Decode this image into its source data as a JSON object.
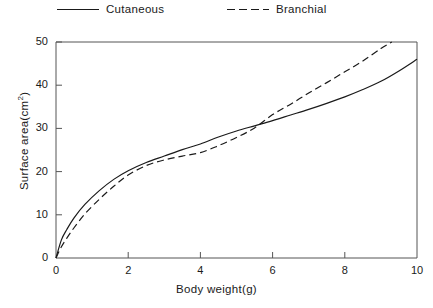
{
  "chart_data": {
    "type": "line",
    "title": "",
    "xlabel": "Body weight(g)",
    "ylabel": "Surface area(cm2)",
    "ylabel_text": "Surface area(cm",
    "ylabel_sup": "2",
    "ylabel_tail": ")",
    "xlim": [
      0,
      10
    ],
    "ylim": [
      0,
      50
    ],
    "xticks": [
      0,
      2,
      4,
      6,
      8,
      10
    ],
    "yticks": [
      0,
      10,
      20,
      30,
      40,
      50
    ],
    "xtick_labels": [
      "0",
      "2",
      "4",
      "6",
      "8",
      "10"
    ],
    "ytick_labels": [
      "0",
      "10",
      "20",
      "30",
      "40",
      "50"
    ],
    "grid": false,
    "legend_position": "above-plot",
    "series": [
      {
        "name": "Cutaneous",
        "style": "solid",
        "color": "#1a1a1a",
        "x": [
          0,
          0.15,
          0.3,
          0.5,
          0.8,
          1.2,
          1.6,
          2,
          2.5,
          3,
          3.5,
          4,
          4.5,
          5,
          5.5,
          6,
          6.5,
          7,
          7.5,
          8,
          8.5,
          9,
          9.5,
          10
        ],
        "y": [
          0,
          4.2,
          6.6,
          9.3,
          12.4,
          15.6,
          18.2,
          20.2,
          22.1,
          23.6,
          25.1,
          26.4,
          28.0,
          29.4,
          30.6,
          31.8,
          33.1,
          34.4,
          35.8,
          37.3,
          39.0,
          40.9,
          43.3,
          46.0
        ]
      },
      {
        "name": "Branchial",
        "style": "dashed",
        "color": "#1a1a1a",
        "x": [
          0,
          0.15,
          0.3,
          0.5,
          0.8,
          1.2,
          1.6,
          2,
          2.5,
          3,
          3.5,
          4,
          4.5,
          5,
          5.5,
          6,
          6.5,
          7,
          7.5,
          8,
          8.5,
          9,
          9.3
        ],
        "y": [
          0,
          2.6,
          4.6,
          7.0,
          10.2,
          13.6,
          16.6,
          19.2,
          21.4,
          22.7,
          23.6,
          24.4,
          26.0,
          27.9,
          30.1,
          33.2,
          35.6,
          38.2,
          40.6,
          43.1,
          45.6,
          48.5,
          50.0
        ]
      }
    ],
    "annotations": []
  },
  "legend": {
    "items": [
      {
        "label": "Cutaneous",
        "style": "solid"
      },
      {
        "label": "Branchial",
        "style": "dashed"
      }
    ]
  }
}
